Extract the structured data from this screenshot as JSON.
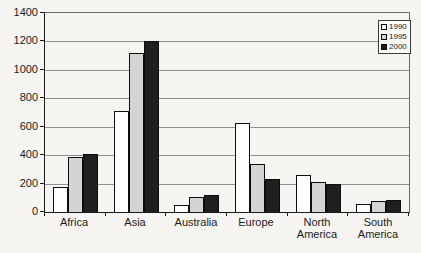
{
  "chart_data": {
    "type": "bar",
    "title": "",
    "xlabel": "",
    "ylabel": "",
    "categories": [
      "Africa",
      "Asia",
      "Australia",
      "Europe",
      "North America",
      "South America"
    ],
    "series": [
      {
        "name": "1990",
        "color": "#ffffff",
        "values": [
          175,
          710,
          50,
          625,
          260,
          55
        ]
      },
      {
        "name": "1995",
        "color": "#d4d4d4",
        "values": [
          390,
          1120,
          105,
          340,
          210,
          80
        ]
      },
      {
        "name": "2000",
        "color": "#1f1f1f",
        "values": [
          410,
          1200,
          120,
          235,
          200,
          85
        ]
      }
    ],
    "ylim": [
      0,
      1400
    ],
    "yticks": [
      0,
      200,
      400,
      600,
      800,
      1000,
      1200,
      1400
    ],
    "grid": true,
    "legend_position": "top-right",
    "colors": {
      "background": "#f6f5f1",
      "gridline": "#8f8f8f",
      "axis": "#1a1a1a",
      "bar_border": "#0d0d0d",
      "legend_border": "#3a3a3a"
    }
  }
}
